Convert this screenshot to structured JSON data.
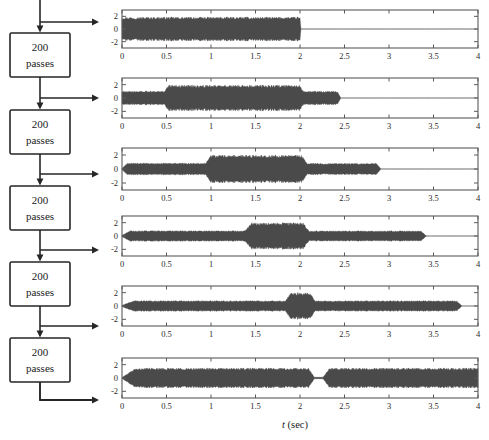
{
  "figure": {
    "width": 489,
    "height": 440,
    "background": "#ffffff",
    "xlabel_italic": "t",
    "xlabel_rest": " (sec)"
  },
  "flowchart": {
    "box_label_line1": "200",
    "box_label_line2": "passes",
    "box_count": 5,
    "stroke": "#262626",
    "fill": "#ffffff",
    "boxes": [
      {
        "label_line1": "200",
        "label_line2": "passes"
      },
      {
        "label_line1": "200",
        "label_line2": "passes"
      },
      {
        "label_line1": "200",
        "label_line2": "passes"
      },
      {
        "label_line1": "200",
        "label_line2": "passes"
      },
      {
        "label_line1": "200",
        "label_line2": "passes"
      }
    ]
  },
  "colors": {
    "signal": "#4a4a4a",
    "axis": "#5a5a5a",
    "text": "#1a1a1a",
    "zero_line": "#bdbdbd"
  },
  "chart_data": [
    {
      "type": "line",
      "title": "",
      "xlabel": "",
      "ylabel": "",
      "xlim": [
        0,
        4
      ],
      "ylim": [
        -3,
        3
      ],
      "xticks": [
        0,
        0.5,
        1,
        1.5,
        2,
        2.5,
        3,
        3.5,
        4
      ],
      "xticklabels": [
        "0",
        "0.5",
        "1",
        "1.5",
        "2",
        "2.5",
        "3",
        "3.5",
        "4"
      ],
      "yticks": [
        2,
        0,
        -2
      ],
      "yticklabels": [
        "2",
        "0",
        "-2"
      ],
      "grid": false,
      "series": [
        {
          "name": "0 passes (input)",
          "description": "Noise-like oscillation, envelope amplitude ~1.9 from t=0 to t=2.0, silent afterwards",
          "envelope": [
            {
              "t": 0.0,
              "a": 1.9
            },
            {
              "t": 0.02,
              "a": 1.9
            },
            {
              "t": 1.98,
              "a": 1.9
            },
            {
              "t": 2.0,
              "a": 1.9
            },
            {
              "t": 2.01,
              "a": 0.0
            },
            {
              "t": 4.0,
              "a": 0.0
            }
          ]
        }
      ]
    },
    {
      "type": "line",
      "title": "",
      "xlabel": "",
      "ylabel": "",
      "xlim": [
        0,
        4
      ],
      "ylim": [
        -3,
        3
      ],
      "xticks": [
        0,
        0.5,
        1,
        1.5,
        2,
        2.5,
        3,
        3.5,
        4
      ],
      "xticklabels": [
        "0",
        "0.5",
        "1",
        "1.5",
        "2",
        "2.5",
        "3",
        "3.5",
        "4"
      ],
      "yticks": [
        2,
        0,
        -2
      ],
      "yticklabels": [
        "2",
        "0",
        "-2"
      ],
      "grid": false,
      "series": [
        {
          "name": "after 200 passes",
          "description": "Amplitude ~1.05 from 0 to 0.5, ~1.95 from 0.5 to 2.02, ~1.05 from 2.02 to 2.45, silent afterwards",
          "envelope": [
            {
              "t": 0.0,
              "a": 1.05
            },
            {
              "t": 0.48,
              "a": 1.05
            },
            {
              "t": 0.52,
              "a": 1.95
            },
            {
              "t": 2.0,
              "a": 1.95
            },
            {
              "t": 2.04,
              "a": 1.05
            },
            {
              "t": 2.42,
              "a": 1.0
            },
            {
              "t": 2.46,
              "a": 0.0
            },
            {
              "t": 4.0,
              "a": 0.0
            }
          ]
        }
      ]
    },
    {
      "type": "line",
      "title": "",
      "xlabel": "",
      "ylabel": "",
      "xlim": [
        0,
        4
      ],
      "ylim": [
        -3,
        3
      ],
      "xticks": [
        0,
        0.5,
        1,
        1.5,
        2,
        2.5,
        3,
        3.5,
        4
      ],
      "xticklabels": [
        "0",
        "0.5",
        "1",
        "1.5",
        "2",
        "2.5",
        "3",
        "3.5",
        "4"
      ],
      "yticks": [
        2,
        0,
        -2
      ],
      "yticklabels": [
        "2",
        "0",
        "-2"
      ],
      "grid": false,
      "series": [
        {
          "name": "after 400 passes",
          "description": "Amplitude ~0.85 from 0.05 to 0.95, ~2.0 from 1.0 to 2.05, ~0.8 from 2.08 to 2.9, silent afterwards",
          "envelope": [
            {
              "t": 0.0,
              "a": 0.1
            },
            {
              "t": 0.06,
              "a": 0.85
            },
            {
              "t": 0.94,
              "a": 0.85
            },
            {
              "t": 1.0,
              "a": 2.0
            },
            {
              "t": 2.02,
              "a": 2.0
            },
            {
              "t": 2.08,
              "a": 0.82
            },
            {
              "t": 2.86,
              "a": 0.82
            },
            {
              "t": 2.91,
              "a": 0.0
            },
            {
              "t": 4.0,
              "a": 0.0
            }
          ]
        }
      ]
    },
    {
      "type": "line",
      "title": "",
      "xlabel": "",
      "ylabel": "",
      "xlim": [
        0,
        4
      ],
      "ylim": [
        -3,
        3
      ],
      "xticks": [
        0,
        0.5,
        1,
        1.5,
        2,
        2.5,
        3,
        3.5,
        4
      ],
      "xticklabels": [
        "0",
        "0.5",
        "1",
        "1.5",
        "2",
        "2.5",
        "3",
        "3.5",
        "4"
      ],
      "yticks": [
        2,
        0,
        -2
      ],
      "yticklabels": [
        "2",
        "0",
        "-2"
      ],
      "grid": false,
      "series": [
        {
          "name": "after 600 passes",
          "description": "Amplitude ~0.8 from 0.08 to 1.4, ~2.0 from 1.45 to 2.05, ~0.8 from 2.1 to 3.4, silent afterwards",
          "envelope": [
            {
              "t": 0.0,
              "a": 0.1
            },
            {
              "t": 0.09,
              "a": 0.8
            },
            {
              "t": 1.38,
              "a": 0.8
            },
            {
              "t": 1.45,
              "a": 2.0
            },
            {
              "t": 2.04,
              "a": 2.0
            },
            {
              "t": 2.1,
              "a": 0.78
            },
            {
              "t": 3.36,
              "a": 0.78
            },
            {
              "t": 3.42,
              "a": 0.0
            },
            {
              "t": 4.0,
              "a": 0.0
            }
          ]
        }
      ]
    },
    {
      "type": "line",
      "title": "",
      "xlabel": "",
      "ylabel": "",
      "xlim": [
        0,
        4
      ],
      "ylim": [
        -3,
        3
      ],
      "xticks": [
        0,
        0.5,
        1,
        1.5,
        2,
        2.5,
        3,
        3.5,
        4
      ],
      "xticklabels": [
        "0",
        "0.5",
        "1",
        "1.5",
        "2",
        "2.5",
        "3",
        "3.5",
        "4"
      ],
      "yticks": [
        2,
        0,
        -2
      ],
      "yticklabels": [
        "2",
        "0",
        "-2"
      ],
      "grid": false,
      "series": [
        {
          "name": "after 800 passes",
          "description": "Amplitude ~0.8 from 0.12 to 1.85, bump ~2.0 from 1.88 to 2.13, ~0.8 to 3.8, silent afterwards",
          "envelope": [
            {
              "t": 0.0,
              "a": 0.1
            },
            {
              "t": 0.13,
              "a": 0.8
            },
            {
              "t": 1.84,
              "a": 0.8
            },
            {
              "t": 1.89,
              "a": 2.0
            },
            {
              "t": 2.12,
              "a": 2.0
            },
            {
              "t": 2.17,
              "a": 0.8
            },
            {
              "t": 3.76,
              "a": 0.8
            },
            {
              "t": 3.82,
              "a": 0.0
            },
            {
              "t": 4.0,
              "a": 0.0
            }
          ]
        }
      ]
    },
    {
      "type": "line",
      "title": "",
      "xlabel": "t (sec)",
      "ylabel": "",
      "xlim": [
        0,
        4
      ],
      "ylim": [
        -3,
        3
      ],
      "xticks": [
        0,
        0.5,
        1,
        1.5,
        2,
        2.5,
        3,
        3.5,
        4
      ],
      "xticklabels": [
        "0",
        "0.5",
        "1",
        "1.5",
        "2",
        "2.5",
        "3",
        "3.5",
        "4"
      ],
      "yticks": [
        2,
        0,
        -2
      ],
      "yticklabels": [
        "2",
        "0",
        "-2"
      ],
      "grid": false,
      "series": [
        {
          "name": "after 1000 passes",
          "description": "Amplitude ~1.5 from 0.14 to 2.13, narrow null near 2.2, resumes ~1.5 from 2.32 to 4.0",
          "envelope": [
            {
              "t": 0.0,
              "a": 0.08
            },
            {
              "t": 0.15,
              "a": 1.5
            },
            {
              "t": 2.1,
              "a": 1.5
            },
            {
              "t": 2.16,
              "a": 0.12
            },
            {
              "t": 2.26,
              "a": 0.12
            },
            {
              "t": 2.33,
              "a": 1.5
            },
            {
              "t": 4.0,
              "a": 1.5
            }
          ]
        }
      ]
    }
  ]
}
